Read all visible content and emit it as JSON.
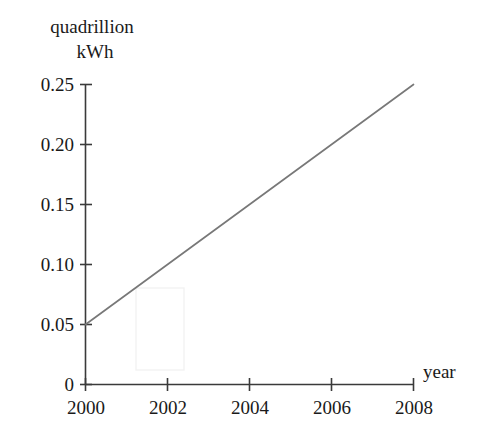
{
  "chart_data": {
    "type": "line",
    "title": "",
    "subtitle": "",
    "xlabel": "year",
    "ylabel": "quadrillion kWh",
    "ylabel_lines": [
      "quadrillion",
      "kWh"
    ],
    "x": [
      2000,
      2008
    ],
    "values": [
      0.05,
      0.25
    ],
    "series": [
      {
        "name": "quadrillion kWh",
        "x": [
          2000,
          2008
        ],
        "values": [
          0.05,
          0.25
        ],
        "color": "#787878"
      }
    ],
    "xlim": [
      2000,
      2008
    ],
    "ylim": [
      0,
      0.25
    ],
    "xticks": [
      2000,
      2002,
      2004,
      2006,
      2008
    ],
    "xtick_labels": [
      "2000",
      "2002",
      "2004",
      "2006",
      "2008"
    ],
    "yticks": [
      0,
      0.05,
      0.1,
      0.15,
      0.2,
      0.25
    ],
    "ytick_labels": [
      "0",
      "0.05",
      "0.10",
      "0.15",
      "0.20",
      "0.25"
    ],
    "grid": false,
    "legend": false,
    "legend_position": "none",
    "annotations": [],
    "axis_color": "#3a3a3a",
    "text_color": "#1a1a1a",
    "background_color": "#ffffff"
  },
  "axes": {
    "y_title_line1": "quadrillion",
    "y_title_line2": "kWh",
    "x_title": "year"
  },
  "ytick_labels": {
    "t0": "0.25",
    "t1": "0.20",
    "t2": "0.15",
    "t3": "0.10",
    "t4": "0.05",
    "t5": "0"
  },
  "xtick_labels": {
    "t0": "2000",
    "t1": "2002",
    "t2": "2004",
    "t3": "2006",
    "t4": "2008"
  }
}
